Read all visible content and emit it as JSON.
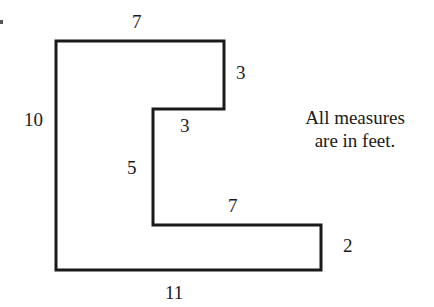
{
  "figure": {
    "shape": "L-shaped polygon",
    "stroke_color": "#1a1a1a",
    "vertices_px": [
      [
        56,
        41
      ],
      [
        224,
        41
      ],
      [
        224,
        109
      ],
      [
        153,
        109
      ],
      [
        153,
        225
      ],
      [
        321,
        225
      ],
      [
        321,
        270
      ],
      [
        56,
        270
      ]
    ]
  },
  "labels": {
    "top": "7",
    "right_upper": "3",
    "inner_step": "3",
    "left": "10",
    "inner_vertical": "5",
    "lower_step": "7",
    "right_lower": "2",
    "bottom": "11"
  },
  "note": {
    "line1": "All measures",
    "line2": "are in feet."
  }
}
